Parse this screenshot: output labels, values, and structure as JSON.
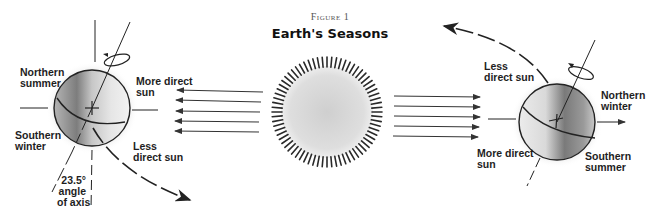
{
  "figure": {
    "number_label": "Figure 1",
    "title": "Earth's Seasons"
  },
  "left_earth": {
    "labels": {
      "northern": "Northern\nsummer",
      "southern": "Southern\nwinter",
      "more_direct": "More direct\nsun",
      "less_direct": "Less\ndirect sun",
      "axis_angle": "23.5°\nangle\nof axis"
    }
  },
  "right_earth": {
    "labels": {
      "northern": "Northern\nwinter",
      "southern": "Southern\nsummer",
      "more_direct": "More direct\nsun",
      "less_direct": "Less\ndirect sun"
    }
  },
  "sun": {
    "ray_count": 72
  },
  "sunlight_arrows": {
    "left_count": 5,
    "right_count": 5
  },
  "colors": {
    "ink": "#1e1e1e",
    "sun_fill": "#d6d6d6",
    "earth_shade": "#8a8a8a",
    "halo": "#e6e6e6"
  }
}
